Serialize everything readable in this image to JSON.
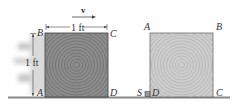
{
  "figure": {
    "left_block": {
      "corners": {
        "top_left": "B",
        "top_right": "C",
        "bottom_left": "A",
        "bottom_right": "D"
      },
      "width_label": "1 ft",
      "height_label": "1 ft",
      "velocity_label": "v",
      "fill_color": "#8c8c8c",
      "ring_color": "#6e6e6e"
    },
    "right_block": {
      "corners": {
        "top_left": "A",
        "top_right": "B",
        "bottom_left": "D",
        "bottom_right": "C"
      },
      "stop_label": "S",
      "fill_color": "#cdcdcd",
      "ring_color": "#b5b5b5"
    },
    "ground_color": "#8a8a8a"
  }
}
